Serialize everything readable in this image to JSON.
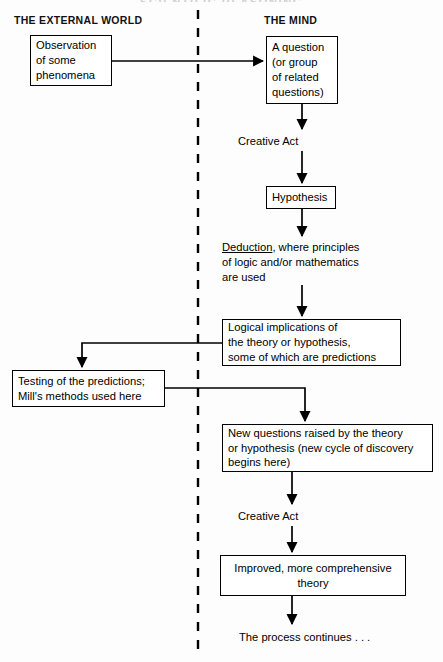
{
  "diagram": {
    "title_clipped": "SCIENTIFIC REASONING",
    "columns": {
      "left_label": "THE EXTERNAL WORLD",
      "right_label": "THE MIND"
    },
    "divider": {
      "name": "dashed-vertical-divider",
      "style": "dashed",
      "color": "#000000"
    },
    "nodes": [
      {
        "id": "observation",
        "text": "Observation\nof some\nphenomena",
        "align": "left",
        "x": 30,
        "y": 35,
        "w": 82,
        "h": 51
      },
      {
        "id": "question",
        "text": "A question\n(or group\nof related\nquestions)",
        "align": "left",
        "x": 266,
        "y": 36,
        "w": 72,
        "h": 68
      },
      {
        "id": "hypothesis",
        "text": "Hypothesis",
        "align": "left",
        "x": 266,
        "y": 186,
        "w": 70,
        "h": 23
      },
      {
        "id": "logical-implications",
        "text": "Logical implications of\nthe theory or hypothesis,\nsome of which are predictions",
        "align": "left",
        "x": 222,
        "y": 319,
        "w": 179,
        "h": 47
      },
      {
        "id": "testing",
        "text": "Testing of the predictions;\nMill's methods used here",
        "align": "left",
        "x": 12,
        "y": 370,
        "w": 153,
        "h": 37
      },
      {
        "id": "new-questions",
        "text": "New questions raised by the theory\nor hypothesis (new cycle of discovery\nbegins here)",
        "align": "left",
        "x": 222,
        "y": 424,
        "w": 211,
        "h": 48
      },
      {
        "id": "improved-theory",
        "text": "Improved, more comprehensive\ntheory",
        "align": "center",
        "x": 220,
        "y": 555,
        "w": 186,
        "h": 41
      }
    ],
    "free_texts": [
      {
        "id": "creative-act-1",
        "text": "Creative Act",
        "x": 238,
        "y": 134
      },
      {
        "id": "deduction-block",
        "text_underlined": "Deduction",
        "text_rest": ", where principles\nof logic and/or mathematics\nare used",
        "x": 222,
        "y": 240
      },
      {
        "id": "creative-act-2",
        "text": "Creative Act",
        "x": 238,
        "y": 509
      },
      {
        "id": "process-continues",
        "text": "The process continues . . .",
        "x": 239,
        "y": 630
      }
    ]
  }
}
